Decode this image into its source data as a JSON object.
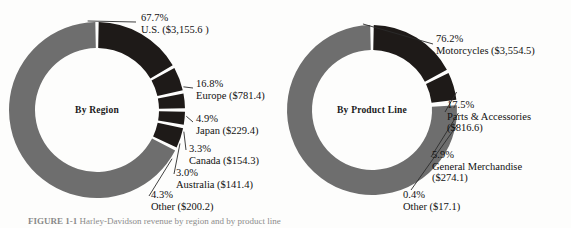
{
  "figure": {
    "caption_number": "FIGURE 1-1",
    "caption_text": "Harley-Davidson revenue by region and by product line"
  },
  "palette": {
    "major_slice": "#6e6e6e",
    "minor_slice": "#1e1a18",
    "background": "#fdfdfc",
    "text": "#111111",
    "leader_line": "#2b2b2b"
  },
  "chart_data": [
    {
      "type": "pie",
      "variant": "donut",
      "title": "By Region",
      "center_label": "By Region",
      "units": "millions of dollars",
      "categories": [
        "U.S.",
        "Europe",
        "Japan",
        "Canada",
        "Australia",
        "Other"
      ],
      "values": [
        3155.6,
        781.4,
        229.4,
        154.3,
        141.4,
        200.2
      ],
      "percentages": [
        67.7,
        16.8,
        4.9,
        3.3,
        3.0,
        4.3
      ],
      "labels": [
        {
          "pct": "67.7%",
          "name": "U.S. ($3,155.6 )",
          "amt2": ""
        },
        {
          "pct": "16.8%",
          "name": "Europe ($781.4)",
          "amt2": ""
        },
        {
          "pct": "4.9%",
          "name": "Japan ($229.4)",
          "amt2": ""
        },
        {
          "pct": "3.3%",
          "name": "Canada ($154.3)",
          "amt2": ""
        },
        {
          "pct": "3.0%",
          "name": "Australia ($141.4)",
          "amt2": ""
        },
        {
          "pct": "4.3%",
          "name": "Other ($200.2)",
          "amt2": ""
        }
      ],
      "slice_colors": [
        "#6e6e6e",
        "#1e1a18",
        "#1e1a18",
        "#1e1a18",
        "#1e1a18",
        "#1e1a18"
      ],
      "legend_position": "callout-labels",
      "grid": false
    },
    {
      "type": "pie",
      "variant": "donut",
      "title": "By Product Line",
      "center_label": "By Product Line",
      "units": "millions of dollars",
      "categories": [
        "Motorcycles",
        "Parts & Accessories",
        "General Merchandise",
        "Other"
      ],
      "values": [
        3554.5,
        816.6,
        274.1,
        17.1
      ],
      "percentages": [
        76.2,
        17.5,
        5.9,
        0.4
      ],
      "labels": [
        {
          "pct": "76.2%",
          "name": "Motorcycles ($3,554.5)",
          "amt2": ""
        },
        {
          "pct": "17.5%",
          "name": "Parts & Accessories",
          "amt2": "($816.6)"
        },
        {
          "pct": "5.9%",
          "name": "General Merchandise",
          "amt2": "($274.1)"
        },
        {
          "pct": "0.4%",
          "name": "Other ($17.1)",
          "amt2": ""
        }
      ],
      "slice_colors": [
        "#6e6e6e",
        "#1e1a18",
        "#1e1a18",
        "#1e1a18"
      ],
      "legend_position": "callout-labels",
      "grid": false
    }
  ]
}
